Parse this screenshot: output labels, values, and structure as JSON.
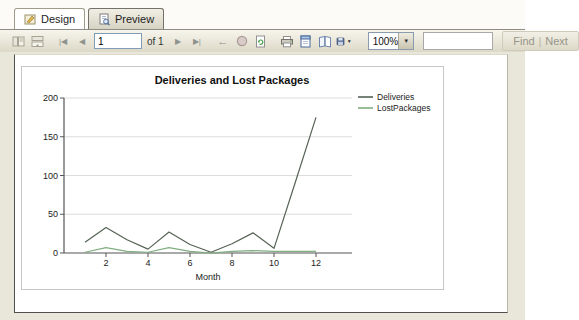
{
  "tabs": {
    "design": "Design",
    "preview": "Preview"
  },
  "toolbar": {
    "page_value": "1",
    "of_label": "of 1",
    "zoom_value": "100%",
    "find_value": "",
    "find_label": "Find",
    "find_separator": "|",
    "next_label": "Next"
  },
  "icons": {
    "first_page": "|◀",
    "prev_page": "◀",
    "next_page": "▶",
    "last_page": "▶|",
    "back_arrow": "←",
    "dropdown_arrow": "▼",
    "export_dropdown": "▼"
  },
  "colors": {
    "deliveries_line": "#556355",
    "lost_packages_line": "#7fae7f",
    "axis": "#555555",
    "gridline": "#dcdcdc",
    "toolbar_bg": "#e5e1d0",
    "page_bg": "#ffffff"
  },
  "chart_data": {
    "type": "line",
    "title": "Deliveries and Lost Packages",
    "xlabel": "Month",
    "ylabel": "",
    "x": [
      1,
      2,
      3,
      4,
      5,
      6,
      7,
      8,
      9,
      10,
      11,
      12
    ],
    "series": [
      {
        "name": "Deliveries",
        "color": "#556355",
        "values": [
          14,
          33,
          17,
          5,
          27,
          11,
          1,
          12,
          26,
          6,
          90,
          175
        ]
      },
      {
        "name": "LostPackages",
        "color": "#7fae7f",
        "values": [
          1,
          7,
          2,
          1,
          7,
          2,
          0,
          2,
          3,
          2,
          2,
          2
        ]
      }
    ],
    "ylim": [
      0,
      200
    ],
    "yticks": [
      0,
      50,
      100,
      150,
      200
    ],
    "xticks": [
      2,
      4,
      6,
      8,
      10,
      12
    ],
    "grid": true,
    "legend_position": "right"
  }
}
